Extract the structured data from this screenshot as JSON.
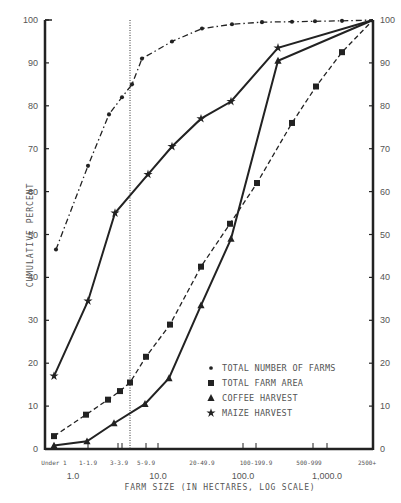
{
  "chart_data": {
    "type": "line",
    "title": "",
    "xlabel": "FARM SIZE (IN HECTARES, LOG SCALE)",
    "ylabel": "CUMULATIVE PERCENT",
    "ylim": [
      0,
      100
    ],
    "yticks": [
      0,
      10,
      20,
      30,
      40,
      50,
      60,
      70,
      80,
      90,
      100
    ],
    "x_scale": "log",
    "x_major_labels": [
      {
        "label": "1.0",
        "px": 73
      },
      {
        "label": "10.0",
        "px": 158
      },
      {
        "label": "100.0",
        "px": 243
      },
      {
        "label": "1,000.0",
        "px": 327
      }
    ],
    "categories": [
      "Under 1",
      "1-1.9",
      "3-3.9",
      "5-9.9",
      "20-49.9",
      "100-199.9",
      "500-999",
      "2500+"
    ],
    "category_label_px": [
      54,
      88,
      119,
      146,
      202,
      256,
      309,
      367
    ],
    "reference_line": {
      "style": "dotted",
      "px": 130
    },
    "series": [
      {
        "name": "TOTAL NUMBER OF FARMS",
        "marker": "circle",
        "line": "dash-dot",
        "points": [
          [
            56,
            46.5
          ],
          [
            88,
            66
          ],
          [
            109,
            78
          ],
          [
            122,
            82
          ],
          [
            132,
            85
          ],
          [
            142,
            91
          ],
          [
            172,
            95
          ],
          [
            202,
            98
          ],
          [
            232,
            99
          ],
          [
            262,
            99.5
          ],
          [
            292,
            99.6
          ],
          [
            315,
            99.7
          ],
          [
            342,
            99.8
          ],
          [
            373,
            100
          ]
        ]
      },
      {
        "name": "TOTAL FARM AREA",
        "marker": "square",
        "line": "dashed",
        "points": [
          [
            54,
            3
          ],
          [
            86,
            8
          ],
          [
            108,
            11.5
          ],
          [
            120,
            13.5
          ],
          [
            130,
            15.5
          ],
          [
            146,
            21.5
          ],
          [
            170,
            29
          ],
          [
            201,
            42.5
          ],
          [
            230,
            52.5
          ],
          [
            257,
            62
          ],
          [
            292,
            76
          ],
          [
            316,
            84.5
          ],
          [
            342,
            92.5
          ],
          [
            373,
            100
          ]
        ]
      },
      {
        "name": "COFFEE HARVEST",
        "marker": "triangle",
        "line": "solid",
        "points": [
          [
            54,
            0.8
          ],
          [
            87,
            1.8
          ],
          [
            114,
            6
          ],
          [
            145,
            10.5
          ],
          [
            169,
            16.5
          ],
          [
            201,
            33.5
          ],
          [
            231,
            49
          ],
          [
            278,
            90.5
          ],
          [
            373,
            100
          ]
        ]
      },
      {
        "name": "MAIZE HARVEST",
        "marker": "star",
        "line": "solid",
        "points": [
          [
            54,
            17
          ],
          [
            88,
            34.5
          ],
          [
            115,
            55
          ],
          [
            148,
            64
          ],
          [
            172,
            70.5
          ],
          [
            201,
            77
          ],
          [
            231,
            81
          ],
          [
            278,
            93.5
          ],
          [
            373,
            100
          ]
        ]
      }
    ],
    "legend": {
      "position": "lower right inside",
      "entries": [
        {
          "marker": "circle",
          "label": "TOTAL NUMBER OF FARMS"
        },
        {
          "marker": "square",
          "label": "TOTAL FARM AREA"
        },
        {
          "marker": "triangle",
          "label": "COFFEE HARVEST"
        },
        {
          "marker": "star",
          "label": "MAIZE HARVEST"
        }
      ]
    },
    "grid": false
  }
}
